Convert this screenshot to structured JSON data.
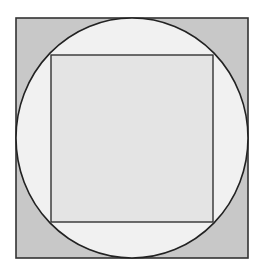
{
  "figure": {
    "outer_square": {
      "x": 16,
      "y": 18,
      "width": 232,
      "height": 240,
      "fill": "#c8c8c8",
      "stroke": "#333333"
    },
    "circle": {
      "cx": 132,
      "cy": 138,
      "rx": 116,
      "ry": 120,
      "fill": "#f1f1f1",
      "stroke": "#222222"
    },
    "inner_square": {
      "x": 51,
      "y": 55,
      "width": 162,
      "height": 167,
      "fill": "#e4e4e4",
      "stroke": "#333333"
    }
  }
}
